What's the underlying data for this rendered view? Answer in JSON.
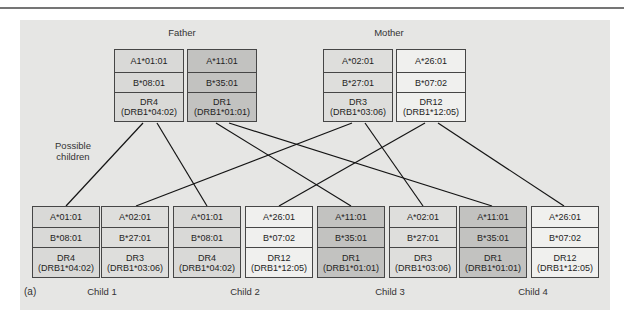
{
  "page": {
    "panel_label": "(a)"
  },
  "parents": {
    "father": {
      "label": "Father",
      "haplotypes": [
        {
          "id": "father-hap-1",
          "a": "A1*01:01",
          "b": "B*08:01",
          "dr": "DR4",
          "drb1": "(DRB1*04:02)",
          "shade": "#d9d9d7"
        },
        {
          "id": "father-hap-2",
          "a": "A*11:01",
          "b": "B*35:01",
          "dr": "DR1",
          "drb1": "(DRB1*01:01)",
          "shade": "#c2c2c0"
        }
      ]
    },
    "mother": {
      "label": "Mother",
      "haplotypes": [
        {
          "id": "mother-hap-1",
          "a": "A*02:01",
          "b": "B*27:01",
          "dr": "DR3",
          "drb1": "(DRB1*03:06)",
          "shade": "#dededc"
        },
        {
          "id": "mother-hap-2",
          "a": "A*26:01",
          "b": "B*07:02",
          "dr": "DR12",
          "drb1": "(DRB1*12:05)",
          "shade": "#f0f0ee"
        }
      ]
    }
  },
  "possible_children_label": "Possible children",
  "children": [
    {
      "label": "Child 1",
      "paternal_haplotype": "father-hap-1",
      "maternal_haplotype": "mother-hap-1"
    },
    {
      "label": "Child 2",
      "paternal_haplotype": "father-hap-1",
      "maternal_haplotype": "mother-hap-2"
    },
    {
      "label": "Child 3",
      "paternal_haplotype": "father-hap-2",
      "maternal_haplotype": "mother-hap-1"
    },
    {
      "label": "Child 4",
      "paternal_haplotype": "father-hap-2",
      "maternal_haplotype": "mother-hap-2"
    }
  ],
  "child_haplotype_boxes": [
    {
      "child": "Child 1",
      "source": "father-hap-1",
      "a": "A*01:01",
      "b": "B*08:01",
      "dr": "DR4",
      "drb1": "(DRB1*04:02)",
      "shade": "#d9d9d7"
    },
    {
      "child": "Child 1",
      "source": "mother-hap-1",
      "a": "A*02:01",
      "b": "B*27:01",
      "dr": "DR3",
      "drb1": "(DRB1*03:06)",
      "shade": "#dededc"
    },
    {
      "child": "Child 2",
      "source": "father-hap-1",
      "a": "A*01:01",
      "b": "B*08:01",
      "dr": "DR4",
      "drb1": "(DRB1*04:02)",
      "shade": "#d9d9d7"
    },
    {
      "child": "Child 2",
      "source": "mother-hap-2",
      "a": "A*26:01",
      "b": "B*07:02",
      "dr": "DR12",
      "drb1": "(DRB1*12:05)",
      "shade": "#f0f0ee"
    },
    {
      "child": "Child 3",
      "source": "father-hap-2",
      "a": "A*11:01",
      "b": "B*35:01",
      "dr": "DR1",
      "drb1": "(DRB1*01:01)",
      "shade": "#c2c2c0"
    },
    {
      "child": "Child 3",
      "source": "mother-hap-1",
      "a": "A*02:01",
      "b": "B*27:01",
      "dr": "DR3",
      "drb1": "(DRB1*03:06)",
      "shade": "#dededc"
    },
    {
      "child": "Child 4",
      "source": "father-hap-2",
      "a": "A*11:01",
      "b": "B*35:01",
      "dr": "DR1",
      "drb1": "(DRB1*01:01)",
      "shade": "#c2c2c0"
    },
    {
      "child": "Child 4",
      "source": "mother-hap-2",
      "a": "A*26:01",
      "b": "B*07:02",
      "dr": "DR12",
      "drb1": "(DRB1*12:05)",
      "shade": "#f0f0ee"
    }
  ],
  "colors": {
    "panel_background": "#e6e6e4",
    "box_border": "#464646",
    "line": "#141414",
    "father_hap1_shade": "#d9d9d7",
    "father_hap2_shade": "#c2c2c0",
    "mother_hap1_shade": "#dededc",
    "mother_hap2_shade": "#f0f0ee"
  }
}
